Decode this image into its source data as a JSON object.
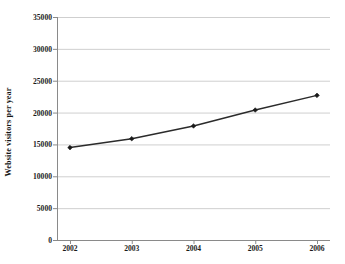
{
  "chart_data": {
    "type": "line",
    "title": "",
    "xlabel": "",
    "ylabel": "Website visitors per year",
    "categories": [
      "2002",
      "2003",
      "2004",
      "2005",
      "2006"
    ],
    "values": [
      14500,
      15900,
      17900,
      20400,
      22700
    ],
    "series": [
      {
        "name": "Website visitors per year",
        "values": [
          14500,
          15900,
          17900,
          20400,
          22700
        ]
      }
    ],
    "ylim": [
      0,
      35000
    ],
    "ytick_values": [
      0,
      5000,
      10000,
      15000,
      20000,
      25000,
      30000,
      35000
    ],
    "ytick_labels": [
      "0",
      "5000",
      "10000",
      "15000",
      "20000",
      "25000",
      "30000",
      "35000"
    ],
    "xtick_labels": [
      "2002",
      "2003",
      "2004",
      "2005",
      "2006"
    ],
    "grid": "horizontal",
    "legend": "none",
    "marker": "diamond",
    "line_color": "#2b2b2b",
    "marker_color": "#1a1a1a",
    "grid_color": "#c9c9c9",
    "axis_color": "#8a8a8a",
    "background_color": "#ffffff"
  }
}
